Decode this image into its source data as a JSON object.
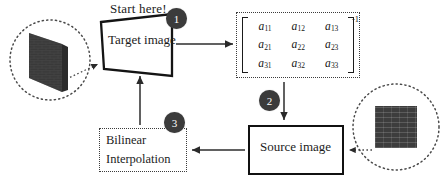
{
  "diagram": {
    "title_note": "Start here!",
    "nodes": {
      "target_image": {
        "label": "Target image",
        "shape": "trapezoid",
        "border": "solid-black"
      },
      "source_image": {
        "label": "Source image",
        "shape": "rectangle",
        "border": "solid-black"
      },
      "bilinear": {
        "line1": "Bilinear",
        "line2": "Interpolation",
        "shape": "rectangle",
        "border": "dotted"
      },
      "matrix": {
        "exponent": "-1",
        "rows": [
          [
            "a",
            "a",
            "a"
          ],
          [
            "a",
            "a",
            "a"
          ],
          [
            "a",
            "a",
            "a"
          ]
        ],
        "subscripts": [
          [
            "11",
            "12",
            "13"
          ],
          [
            "21",
            "22",
            "23"
          ],
          [
            "31",
            "32",
            "33"
          ]
        ]
      }
    },
    "badges": [
      {
        "number": "1",
        "attached_to": "target-image"
      },
      {
        "number": "2",
        "attached_to": "matrix-to-source-arrow"
      },
      {
        "number": "3",
        "attached_to": "bilinear-interpolation"
      }
    ],
    "thumbnails": [
      {
        "name": "warped-target-thumbnail",
        "style": "dark-skewed-brick-texture"
      },
      {
        "name": "source-brick-thumbnail",
        "style": "dark-square-brick-texture"
      }
    ],
    "edges": [
      {
        "name": "target-to-matrix",
        "from": "Target image",
        "to": "matrix",
        "style": "solid-arrow"
      },
      {
        "name": "matrix-to-source",
        "from": "matrix",
        "to": "Source image",
        "style": "solid-arrow"
      },
      {
        "name": "source-to-bilinear",
        "from": "Source image",
        "to": "Bilinear Interpolation",
        "style": "solid-arrow"
      },
      {
        "name": "bilinear-to-target",
        "from": "Bilinear Interpolation",
        "to": "Target image",
        "style": "solid-arrow"
      },
      {
        "name": "target-thumb-callout",
        "from": "warped-target-thumbnail",
        "to": "Target image",
        "style": "dotted-arrow"
      },
      {
        "name": "source-thumb-callout",
        "from": "source-brick-thumbnail",
        "to": "Source image",
        "style": "dotted-arrow"
      }
    ],
    "colors": {
      "badge_fill": "#3b3b3b",
      "badge_text": "#ffffff",
      "stroke": "#1a1a1a",
      "dotted_stroke": "#3c3c3c",
      "texture": "#3d3d3d",
      "background": "#ffffff"
    }
  }
}
